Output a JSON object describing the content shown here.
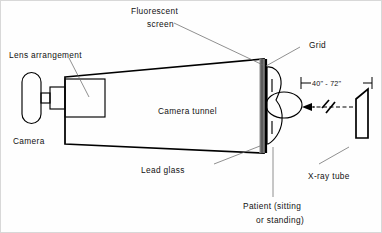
{
  "figure": {
    "title_semantics": "photofluorographic chest x-ray unit schematic",
    "background_color": "#fefefe",
    "line_color": "#000000",
    "leader_color": "#6b6b6b"
  },
  "labels": {
    "fluorescent_screen_line1": "Fluorescent",
    "fluorescent_screen_line2": "screen",
    "grid": "Grid",
    "lens_arrangement": "Lens arrangement",
    "camera": "Camera",
    "camera_tunnel": "Camera tunnel",
    "lead_glass": "Lead glass",
    "patient_line1": "Patient (sitting",
    "patient_line2": "or standing)",
    "xray_tube": "X-ray tube",
    "distance": "40\" - 72\""
  },
  "parts": {
    "camera_body_name": "camera-body",
    "camera_lens_name": "lens-arrangement-box",
    "tunnel_name": "camera-tunnel-trapezoid",
    "screen_name": "fluorescent-screen-panel",
    "grid_name": "grid-strip",
    "patient_name": "patient-figure",
    "tube_name": "x-ray-tube-body",
    "ray_name": "x-ray-beam-dashed-ray"
  }
}
